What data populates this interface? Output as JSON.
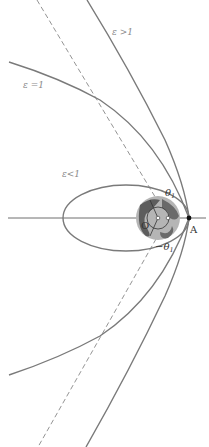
{
  "diagram": {
    "type": "orbits-conic-sections",
    "labels": {
      "hyperbola": "ε >1",
      "parabola": "ε =1",
      "ellipse": "ε<1",
      "theta_pos": "θ",
      "theta_pos_sub": "1",
      "theta_neg": "−θ",
      "theta_neg_sub": "1",
      "point_a": "A",
      "focus_o": "O"
    },
    "colors": {
      "curve": "#7a7a7a",
      "label": "#8a8a8a",
      "axis": "#6e6e6e",
      "earth_dark": "#5d5d5d",
      "earth_light": "#b5b5b5"
    }
  }
}
